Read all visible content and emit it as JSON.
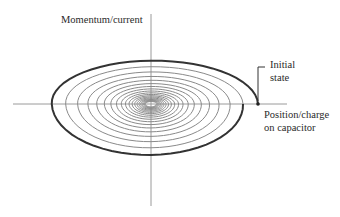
{
  "diagram": {
    "type": "phase-space spiral (damped oscillator)",
    "labels": {
      "y_axis": "Momentum/current",
      "initial_state_line1": "Initial",
      "initial_state_line2": "state",
      "x_axis_line1": "Position/charge",
      "x_axis_line2": "on capacitor"
    },
    "geometry": {
      "origin": [
        151,
        104
      ],
      "x_axis": [
        13,
        287
      ],
      "y_axis": [
        14,
        206
      ],
      "initial_point": [
        258,
        104
      ],
      "outer_rx": 107,
      "outer_ry_top": 45,
      "outer_ry_bottom": 57,
      "turns": 20
    },
    "colors": {
      "axis": "#9a9a9a",
      "spiral_outer": "#333333",
      "spiral_inner": "#8a8a8a",
      "text": "#2a2a2a"
    }
  }
}
